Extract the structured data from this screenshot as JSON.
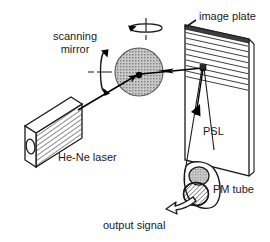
{
  "figure": {
    "background_color": "#ffffff",
    "ink_color": "#1a1a1a",
    "mirror_fill": "#b3b3b3",
    "plate_edge_color": "#4d4d4d",
    "width": 270,
    "height": 242
  },
  "labels": {
    "scanning_mirror_line1": "scanning",
    "scanning_mirror_line2": "mirror",
    "image_plate": "image plate",
    "he_ne_laser": "He-Ne laser",
    "psl": "PSL",
    "pm_tube": "PM tube",
    "output_signal": "output signal"
  },
  "components": [
    {
      "id": "he-ne-laser",
      "label": "He-Ne laser",
      "shape": "isometric-box-hatched",
      "note": "rectangular laser housing with circular exit aperture"
    },
    {
      "id": "scanning-mirror",
      "label": "scanning mirror",
      "shape": "stippled-disc",
      "note": "rotating mirror with two rotation axes"
    },
    {
      "id": "image-plate",
      "label": "image plate",
      "shape": "hatched-parallelogram",
      "note": "storage phosphor plate, horizontally ruled"
    },
    {
      "id": "pm-tube",
      "label": "PM tube",
      "shape": "double-ellipse-cylinder",
      "note": "photomultiplier tube collecting PSL"
    }
  ],
  "beams": [
    {
      "id": "laser-beam",
      "from": "he-ne-laser",
      "to": "scanning-mirror",
      "arrow": "solid"
    },
    {
      "id": "scan-beam",
      "from": "scanning-mirror",
      "to": "image-plate",
      "arrow": "solid"
    },
    {
      "id": "psl-emission",
      "label": "PSL",
      "from": "image-plate",
      "to": "pm-tube",
      "arrow": "solid"
    },
    {
      "id": "output-signal",
      "label": "output signal",
      "from": "pm-tube",
      "arrow": "hollow-curved"
    }
  ],
  "rotation_axes": [
    {
      "id": "vertical-rotation",
      "orientation": "vertical"
    },
    {
      "id": "horizontal-rotation",
      "orientation": "horizontal"
    }
  ]
}
